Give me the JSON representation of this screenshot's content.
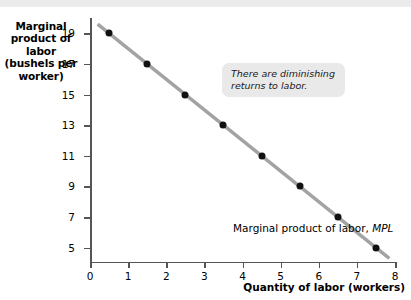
{
  "chart_data": {
    "type": "scatter",
    "title": "",
    "xlabel": "Quantity of labor (workers)",
    "ylabel": "Marginal product of labor (bushels per worker)",
    "ylabel_lines": [
      "Marginal",
      "product of labor",
      "(bushels per",
      "worker)"
    ],
    "x": [
      0.5,
      1.5,
      2.5,
      3.5,
      4.5,
      5.5,
      6.5,
      7.5
    ],
    "values": [
      19,
      17,
      15,
      13,
      11,
      9,
      7,
      5
    ],
    "series": [
      {
        "name": "Marginal product of labor, MPL",
        "x": [
          0.5,
          1.5,
          2.5,
          3.5,
          4.5,
          5.5,
          6.5,
          7.5
        ],
        "values": [
          19,
          17,
          15,
          13,
          11,
          9,
          7,
          5
        ]
      }
    ],
    "xlim": [
      0,
      8
    ],
    "ylim": [
      4,
      20
    ],
    "xticks": [
      0,
      1,
      2,
      3,
      4,
      5,
      6,
      7,
      8
    ],
    "yticks": [
      5,
      7,
      9,
      11,
      13,
      15,
      17,
      19
    ],
    "xtick_labels": [
      "0",
      "1",
      "2",
      "3",
      "4",
      "5",
      "6",
      "7",
      "8"
    ],
    "ytick_labels": [
      "19",
      "17",
      "15",
      "13",
      "11",
      "9",
      "7",
      "5"
    ],
    "grid": false,
    "legend": "none",
    "line_endpoints": {
      "x_start": 0.2,
      "y_start": 19.6,
      "x_end": 7.85,
      "y_end": 4.3
    },
    "annotations": [
      {
        "name": "diminishing-returns-callout",
        "text": "There are diminishing returns to labor.",
        "lines": [
          "There are diminishing",
          "returns to labor."
        ]
      },
      {
        "name": "curve-label",
        "text_plain": "Marginal product of labor, MPL",
        "text_prefix": "Marginal product of labor, ",
        "text_italic": "MPL"
      }
    ],
    "colors": {
      "line": "#a3a3a3",
      "point": "#111111",
      "axis": "#555555",
      "callout_background": "#e9e9e9",
      "background": "#ffffff",
      "top_band": "#ebebeb"
    }
  }
}
